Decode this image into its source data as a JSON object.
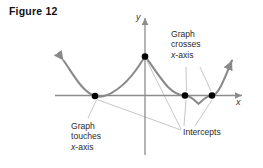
{
  "figure": {
    "title": "Figure 12",
    "background_color": "#ffffff"
  },
  "axes": {
    "y_label": "y",
    "x_label": "x",
    "axis_color": "#8c8c8c",
    "y_axis_x": 145,
    "x_axis_y": 95.5,
    "x_axis_start": 55,
    "x_axis_end": 242,
    "y_axis_top": 18,
    "y_axis_bottom": 155
  },
  "curve": {
    "color": "#8a8a8a",
    "stroke_width": 2.1,
    "path": "M 63.5 60.5 C 72 72, 82 92, 95 96 C 108 100, 126 84, 136 70 C 141 63, 143.5 58.5, 145 56.5 C 150 62, 158 76, 168 87 C 176 95, 181 95.5, 185 95.5 C 191 95.5, 195 101, 198.5 103.8 C 202 101, 206.5 95.5, 212 95.5 C 219 95.5, 226 74, 232 60.5"
  },
  "points": [
    {
      "name": "touch-point",
      "x": 95,
      "y": 96
    },
    {
      "name": "y-intercept",
      "x": 145,
      "y": 56.5
    },
    {
      "name": "cross-point-left",
      "x": 185,
      "y": 95.5
    },
    {
      "name": "cross-point-right",
      "x": 212,
      "y": 95.5
    }
  ],
  "annotations": {
    "crosses": {
      "line1": "Graph",
      "line2": "crosses",
      "line3_prefix": "x",
      "line3_suffix": "-axis"
    },
    "touches": {
      "line1": "Graph",
      "line2": "touches",
      "line3_prefix": "x",
      "line3_suffix": "-axis"
    },
    "intercepts": {
      "label": "Intercepts"
    }
  },
  "leader_lines": {
    "color": "#b3b3b3",
    "stroke_width": 0.75,
    "segments": [
      {
        "name": "crosses-to-left-dot",
        "x1": 186,
        "y1": 67,
        "x2": 186.5,
        "y2": 91
      },
      {
        "name": "crosses-to-right-dot",
        "x1": 200,
        "y1": 67,
        "x2": 211,
        "y2": 91
      },
      {
        "name": "touches-to-dot",
        "x1": 88,
        "y1": 118,
        "x2": 96.5,
        "y2": 100
      },
      {
        "name": "intercepts-to-touch-dot",
        "x1": 181,
        "y1": 130,
        "x2": 97,
        "y2": 99.5
      },
      {
        "name": "intercepts-to-y-intercept",
        "x1": 181,
        "y1": 129,
        "x2": 147,
        "y2": 61
      },
      {
        "name": "intercepts-to-cross-left",
        "x1": 184,
        "y1": 126,
        "x2": 186,
        "y2": 100
      },
      {
        "name": "intercepts-to-cross-right",
        "x1": 195,
        "y1": 126,
        "x2": 212,
        "y2": 100
      }
    ]
  },
  "chart_data": {
    "type": "line",
    "title": "Figure 12",
    "xlabel": "x",
    "ylabel": "y",
    "grid": false,
    "legend": "none",
    "marked_points": [
      {
        "label": "Graph touches x-axis",
        "role": "x-intercept (touch / even multiplicity)"
      },
      {
        "label": "y-intercept",
        "role": "y-intercept"
      },
      {
        "label": "Graph crosses x-axis",
        "role": "x-intercept (cross / odd multiplicity)"
      },
      {
        "label": "Graph crosses x-axis",
        "role": "x-intercept (cross / odd multiplicity)"
      }
    ]
  }
}
